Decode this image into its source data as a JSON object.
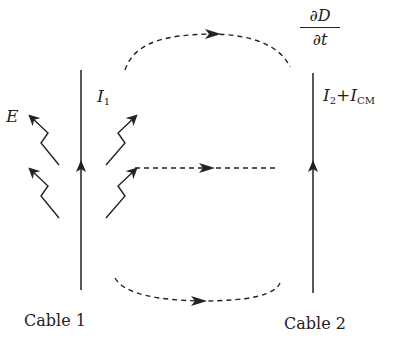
{
  "diagram": {
    "cable1": {
      "label": "Cable 1",
      "current_label": "I",
      "current_sub": "1"
    },
    "cable2": {
      "label": "Cable 2",
      "current_main": "I",
      "current_sub1": "2",
      "plus": "+",
      "current_cm": "I",
      "current_sub2": "CM"
    },
    "field_label": "E",
    "displacement": {
      "numerator": "∂D",
      "denominator": "∂t"
    },
    "colors": {
      "ink": "#222222",
      "background": "#ffffff"
    }
  }
}
